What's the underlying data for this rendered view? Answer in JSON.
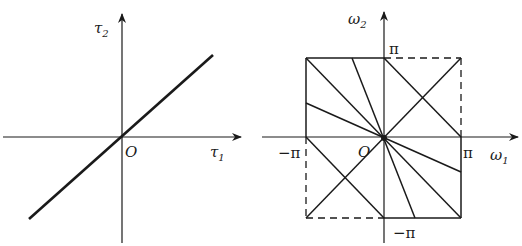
{
  "left_panel": {
    "y_axis_label": "τ",
    "y_axis_sub": "2",
    "x_axis_label": "τ",
    "x_axis_sub": "1",
    "origin_label": "O"
  },
  "right_panel": {
    "y_axis_label": "ω",
    "y_axis_sub": "2",
    "x_axis_label": "ω",
    "x_axis_sub": "1",
    "origin_label": "O",
    "tick_pi_top": "π",
    "tick_pi_right": "π",
    "tick_neg_pi_left": "−π",
    "tick_neg_pi_bottom": "−π"
  },
  "colors": {
    "line": "#1a1a1a",
    "background": "#ffffff"
  }
}
